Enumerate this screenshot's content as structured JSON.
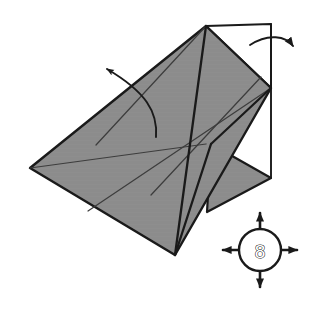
{
  "figure": {
    "background_color": "#ffffff",
    "paper_front_color": "#8c8c8c",
    "paper_back_color": "#ffffff",
    "outline_color": "#1a1a1a",
    "crease_color": "#4a4a4a",
    "arrow_color": "#1a1a1a"
  },
  "step_badge": {
    "number": "8",
    "center_x": 260,
    "center_y": 250,
    "radius": 21,
    "arrow_directions": [
      "up",
      "right",
      "down",
      "left"
    ],
    "circle_fill": "#ffffff",
    "circle_stroke": "#1a1a1a"
  },
  "arrows": [
    {
      "name": "fold-arrow-upper-left",
      "label": "",
      "direction": "up-left",
      "style": "curved",
      "tip_x": 103,
      "tip_y": 65,
      "tail_x": 156,
      "tail_y": 137
    },
    {
      "name": "fold-arrow-top-right",
      "label": "",
      "direction": "right",
      "style": "curved",
      "tip_x": 298,
      "tip_y": 47,
      "tail_x": 250,
      "tail_y": 44
    }
  ],
  "shape": {
    "shaded_main_polygon": "30,168 206,26 271,88 175,255",
    "shaded_flap_polygon": "211,144 271,178 207,212",
    "white_flap_polygon": "206,26 271,24 271,88",
    "vertical_edge": "271,24 271,178",
    "crease_lines": [
      "96,145 206,26",
      "151,195 261,77",
      "30,168 206,144",
      "88,211 271,88",
      "211,144 175,255",
      "206,26 175,255"
    ],
    "grid_vertices": [
      "96,145",
      "151,195",
      "206,144",
      "261,77",
      "88,211",
      "211,144"
    ]
  }
}
